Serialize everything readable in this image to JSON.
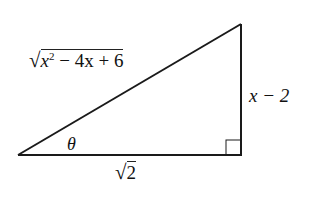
{
  "diagram": {
    "type": "right-triangle",
    "vertices": {
      "left": [
        18,
        155
      ],
      "top_right": [
        241,
        24
      ],
      "bottom_right": [
        241,
        155
      ]
    },
    "right_angle_marker": true,
    "labels": {
      "hypotenuse": {
        "radical": "√",
        "radicand_pre": "x",
        "exponent": "2",
        "radicand_post": " − 4x + 6"
      },
      "opposite": "x − 2",
      "adjacent": {
        "radical": "√",
        "radicand": "2"
      },
      "angle": "θ"
    }
  }
}
